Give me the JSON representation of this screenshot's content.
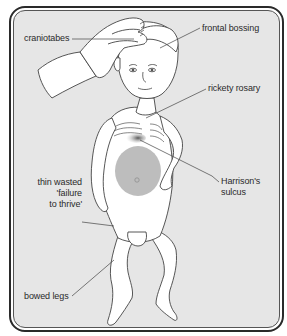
{
  "diagram": {
    "labels": {
      "craniotabes": "craniotabes",
      "frontal_bossing": "frontal bossing",
      "rickety_rosary": "rickety rosary",
      "harrisons_sulcus_line1": "Harrison's",
      "harrisons_sulcus_line2": "sulcus",
      "failure_line1": "thin wasted",
      "failure_line2": "'failure",
      "failure_line3": "to thrive'",
      "bowed_legs": "bowed legs"
    },
    "colors": {
      "background": "#e6e6e6",
      "frame": "#2a2a2a",
      "skin": "#ffffff",
      "outline": "#444444",
      "abdomen_shading": "#bdbdbd",
      "sulcus_shading": "#7a7a7a"
    }
  }
}
